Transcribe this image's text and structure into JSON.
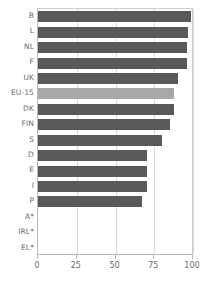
{
  "chart_data": {
    "type": "bar",
    "orientation": "horizontal",
    "title": "",
    "xlabel": "",
    "ylabel": "",
    "xlim": [
      0,
      100
    ],
    "xticks": [
      0,
      25,
      50,
      75,
      100
    ],
    "grid": true,
    "legend": false,
    "highlight_category": "EU-15",
    "categories": [
      "B",
      "L",
      "NL",
      "F",
      "UK",
      "EU-15",
      "DK",
      "FIN",
      "S",
      "D",
      "E",
      "I",
      "P",
      "A*",
      "IRL*",
      "EL*"
    ],
    "values": [
      99,
      97,
      96,
      96,
      90,
      88,
      88,
      85,
      80,
      70,
      70,
      70,
      67,
      0,
      0,
      0
    ],
    "colors": {
      "bar": "#595959",
      "bar_highlight": "#a8a8a8",
      "grid": "#d8d8d8",
      "axis": "#b9b9b9",
      "text": "#6b6b6b",
      "background": "#ffffff"
    }
  }
}
